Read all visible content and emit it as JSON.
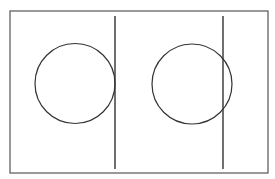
{
  "diagram": {
    "stroke_color": "#333333",
    "frame": {
      "x": 10,
      "y": 11,
      "width": 258,
      "height": 162,
      "stroke": "#555555"
    },
    "panels": [
      {
        "label": "tangent",
        "circle": {
          "cx": 75,
          "cy": 83.5,
          "r": 40
        },
        "line": {
          "x": 115,
          "y1": 16,
          "y2": 169
        }
      },
      {
        "label": "secant",
        "circle": {
          "cx": 192,
          "cy": 84,
          "r": 40
        },
        "line": {
          "x": 223,
          "y1": 16,
          "y2": 169
        }
      }
    ]
  }
}
